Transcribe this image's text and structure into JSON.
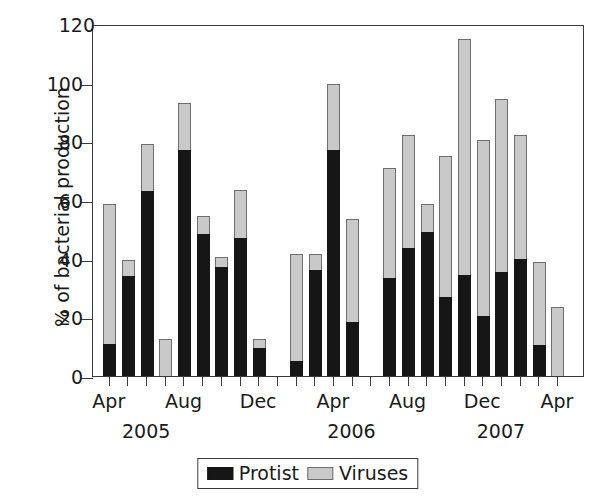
{
  "chart_data": {
    "type": "bar",
    "subtype": "stacked-vertical",
    "title": "",
    "xlabel": "",
    "ylabel": "% of bacterial production",
    "ylim": [
      0,
      120
    ],
    "ytick_values": [
      0,
      20,
      40,
      60,
      80,
      100,
      120
    ],
    "ytick_labels": [
      "0",
      "20",
      "40",
      "60",
      "80",
      "100",
      "120"
    ],
    "grid": false,
    "legend_position": "bottom-center",
    "x_month_labels": [
      "Apr",
      "Aug",
      "Dec",
      "Apr",
      "Aug",
      "Dec",
      "Apr"
    ],
    "x_year_labels": [
      "2005",
      "2006",
      "2007"
    ],
    "categories": [
      "Apr 2005",
      "May 2005",
      "Jun 2005",
      "Jul 2005",
      "Aug 2005",
      "Sep 2005",
      "Oct 2005",
      "Nov 2005",
      "Dec 2005",
      "Jan 2006",
      "Feb 2006",
      "Mar 2006",
      "Apr 2006",
      "May 2006",
      "Jun 2006",
      "Jul 2006",
      "Aug 2006",
      "Sep 2006",
      "Oct 2006",
      "Nov 2006",
      "Dec 2006",
      "Jan 2007",
      "Feb 2007",
      "Mar 2007",
      "Apr 2007"
    ],
    "series": [
      {
        "name": "Protist",
        "color": "#161616",
        "values": [
          11,
          34,
          63,
          0,
          77,
          48.5,
          37,
          47,
          9.5,
          0,
          5,
          36,
          77,
          18.5,
          0,
          33.5,
          43.5,
          49,
          27,
          34.5,
          20.5,
          35.5,
          40,
          10.5,
          0
        ]
      },
      {
        "name": "Viruses",
        "color": "#c9c9c9",
        "values": [
          47.5,
          5.5,
          16,
          12.5,
          16,
          6,
          3.5,
          16.5,
          3,
          0,
          36.5,
          5.5,
          22.5,
          35,
          0,
          37.5,
          38.5,
          9.5,
          48,
          80.5,
          60,
          59,
          42,
          28.5,
          23.5
        ]
      }
    ],
    "totals": [
      58.5,
      39.5,
      79,
      12.5,
      93,
      54.5,
      40.5,
      63.5,
      12.5,
      0,
      41.5,
      41.5,
      99.5,
      53.5,
      0,
      71,
      82,
      58.5,
      75,
      115,
      80.5,
      94.5,
      82,
      39,
      23.5
    ]
  },
  "legend": {
    "entries": [
      {
        "label": "Protist",
        "swatch": "black-swatch-icon"
      },
      {
        "label": "Viruses",
        "swatch": "gray-swatch-icon"
      }
    ]
  },
  "colors": {
    "protist": "#161616",
    "viruses": "#c9c9c9",
    "axis": "#3a3a3a",
    "background": "#ffffff"
  }
}
